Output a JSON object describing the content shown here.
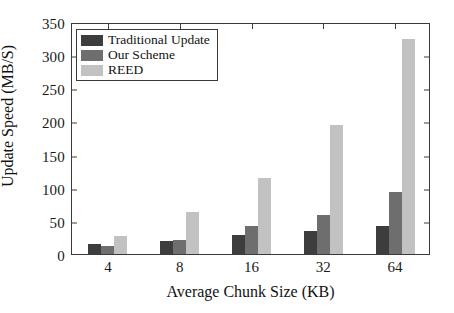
{
  "chart_data": {
    "type": "bar",
    "title": "",
    "xlabel": "Average Chunk Size (KB)",
    "ylabel": "Update Speed (MB/S)",
    "categories": [
      "4",
      "8",
      "16",
      "32",
      "64"
    ],
    "series": [
      {
        "name": "Traditional Update",
        "color": "#3d3d3d",
        "values": [
          15,
          20,
          28,
          34,
          43
        ]
      },
      {
        "name": "Our Scheme",
        "color": "#6e6e6e",
        "values": [
          12,
          21,
          42,
          59,
          94
        ]
      },
      {
        "name": "REED",
        "color": "#c2c2c2",
        "values": [
          27,
          63,
          115,
          194,
          324
        ]
      }
    ],
    "ylim": [
      0,
      350
    ],
    "yticks": [
      0,
      50,
      100,
      150,
      200,
      250,
      300,
      350
    ],
    "ytick_labels": [
      "0",
      "50",
      "100",
      "150",
      "200",
      "250",
      "300",
      "350"
    ],
    "grid": false,
    "legend_position": "upper-left"
  },
  "axes": {
    "y_title": "Update Speed (MB/S)",
    "x_title": "Average Chunk Size (KB)"
  },
  "legend": {
    "entries": [
      {
        "label": "Traditional Update",
        "color": "#3d3d3d"
      },
      {
        "label": "Our Scheme",
        "color": "#6e6e6e"
      },
      {
        "label": "REED",
        "color": "#c2c2c2"
      }
    ]
  }
}
